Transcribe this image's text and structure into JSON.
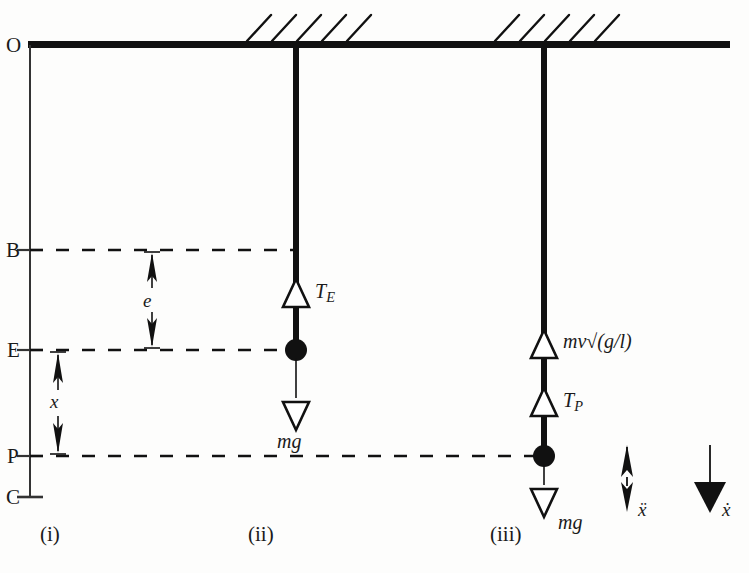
{
  "figure": {
    "background_color": "#fdfdfc",
    "ink_color": "#111111"
  },
  "axis": {
    "name": "vertical-reference-axis",
    "x": 30,
    "top_y": 45,
    "bottom_y": 497,
    "points": [
      {
        "label": "O",
        "y": 45,
        "name": "point-o"
      },
      {
        "label": "B",
        "y": 250,
        "name": "point-b"
      },
      {
        "label": "E",
        "y": 350,
        "name": "point-e"
      },
      {
        "label": "P",
        "y": 456,
        "name": "point-p"
      },
      {
        "label": "C",
        "y": 497,
        "name": "point-c"
      }
    ]
  },
  "ceiling": {
    "name": "ceiling-support-line",
    "x_start": 28,
    "x_end": 730,
    "y": 45,
    "hatch_groups": [
      {
        "name": "hatching-support-ii",
        "center_x": 297,
        "count": 5
      },
      {
        "name": "hatching-support-iii",
        "center_x": 545,
        "count": 5
      }
    ]
  },
  "dimensions": [
    {
      "label": "e",
      "name": "dimension-e",
      "x": 152,
      "from_y": 250,
      "to_y": 350
    },
    {
      "label": "x",
      "name": "dimension-x",
      "x": 58,
      "from_y": 350,
      "to_y": 456
    }
  ],
  "dashed_lines": [
    {
      "name": "dashed-line-b",
      "y": 250,
      "x_start": 30,
      "x_end": 297
    },
    {
      "name": "dashed-line-e",
      "y": 350,
      "x_start": 30,
      "x_end": 297
    },
    {
      "name": "dashed-line-p",
      "y": 456,
      "x_start": 30,
      "x_end": 545
    }
  ],
  "cases": [
    {
      "name": "case-i",
      "caption": "(i)",
      "caption_x": 44,
      "caption_y": 536
    },
    {
      "name": "case-ii",
      "caption": "(ii)",
      "caption_x": 252,
      "caption_y": 536,
      "rod_x": 297,
      "rod_top_y": 45,
      "bob_y": 350,
      "forces": [
        {
          "name": "force-tension-e",
          "label": "T",
          "subscript": "E",
          "direction": "up",
          "label_x": 317,
          "label_y": 288
        },
        {
          "name": "force-weight-ii",
          "label": "mg",
          "subscript": "",
          "direction": "down",
          "label_x": 279,
          "label_y": 438
        }
      ]
    },
    {
      "name": "case-iii",
      "caption": "(iii)",
      "caption_x": 494,
      "caption_y": 536,
      "rod_x": 545,
      "rod_top_y": 45,
      "bob_y": 456,
      "forces": [
        {
          "name": "force-impulse-mv",
          "label": "mv√(g/l)",
          "subscript": "",
          "direction": "up",
          "label_x": 566,
          "label_y": 340
        },
        {
          "name": "force-tension-p",
          "label": "T",
          "subscript": "P",
          "direction": "up",
          "label_x": 566,
          "label_y": 398
        },
        {
          "name": "force-weight-iii",
          "label": "mg",
          "subscript": "",
          "direction": "down",
          "label_x": 560,
          "label_y": 520
        }
      ]
    }
  ],
  "legend": [
    {
      "name": "legend-acceleration",
      "label": "ẍ",
      "arrow_style": "barbed-double",
      "x": 627,
      "y": 455,
      "label_x": 642,
      "label_y": 512
    },
    {
      "name": "legend-velocity",
      "label": "ẋ",
      "arrow_style": "solid-triangle",
      "x": 710,
      "y": 455,
      "label_x": 724,
      "label_y": 512
    }
  ]
}
